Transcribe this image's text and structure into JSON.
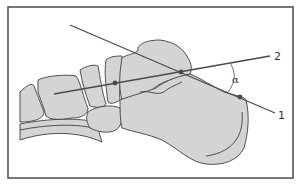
{
  "figure": {
    "type": "anatomical-diagram",
    "labels": {
      "line1": "1",
      "line2": "2",
      "angle": "α"
    },
    "lines": [
      {
        "id": "1",
        "description": "calcaneal line through calcaneus points"
      },
      {
        "id": "2",
        "description": "talar axis line"
      }
    ],
    "angle_name": "α",
    "colors": {
      "bone_fill": "#d4d4d4",
      "outline": "#3f3f3f",
      "axis_line": "#4a4a4a",
      "frame": "#555555"
    }
  }
}
